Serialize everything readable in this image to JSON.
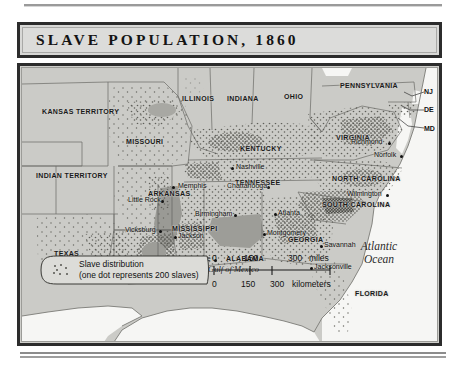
{
  "title": "SLAVE POPULATION, 1860",
  "map": {
    "states": [
      {
        "name": "KANSAS TERRITORY",
        "x": 20,
        "y": 40
      },
      {
        "name": "INDIAN TERRITORY",
        "x": 14,
        "y": 104
      },
      {
        "name": "MISSOURI",
        "x": 104,
        "y": 70
      },
      {
        "name": "ILLINOIS",
        "x": 160,
        "y": 27
      },
      {
        "name": "INDIANA",
        "x": 205,
        "y": 27
      },
      {
        "name": "OHIO",
        "x": 262,
        "y": 25
      },
      {
        "name": "PENNSYLVANIA",
        "x": 318,
        "y": 14
      },
      {
        "name": "KENTUCKY",
        "x": 218,
        "y": 77
      },
      {
        "name": "VIRGINIA",
        "x": 314,
        "y": 66
      },
      {
        "name": "TENNESSEE",
        "x": 213,
        "y": 111
      },
      {
        "name": "ARKANSAS",
        "x": 126,
        "y": 122
      },
      {
        "name": "NORTH CAROLINA",
        "x": 310,
        "y": 107
      },
      {
        "name": "SOUTH CAROLINA",
        "x": 305,
        "y": 136
      },
      {
        "name": "MISSISSIPPI",
        "x": 156,
        "y": 157
      },
      {
        "name": "ALABAMA",
        "x": 204,
        "y": 187
      },
      {
        "name": "GEORGIA",
        "x": 270,
        "y": 168
      },
      {
        "name": "LOUISIANA",
        "x": 112,
        "y": 190
      },
      {
        "name": "TEXAS",
        "x": 32,
        "y": 182
      },
      {
        "name": "FLORIDA",
        "x": 337,
        "y": 222
      }
    ],
    "state_abbreviations": [
      {
        "name": "NJ",
        "x": 402,
        "y": 20
      },
      {
        "name": "DE",
        "x": 402,
        "y": 38
      },
      {
        "name": "MD",
        "x": 402,
        "y": 57
      }
    ],
    "cities": [
      {
        "name": "Richmond",
        "x": 329,
        "y": 73,
        "dot": "right"
      },
      {
        "name": "Norfolk",
        "x": 352,
        "y": 86,
        "dot": "right"
      },
      {
        "name": "Nashville",
        "x": 214,
        "y": 98,
        "dot": "left"
      },
      {
        "name": "Memphis",
        "x": 156,
        "y": 117,
        "dot": "right"
      },
      {
        "name": "Chattanooga",
        "x": 205,
        "y": 117,
        "dot": "right"
      },
      {
        "name": "Little Rock",
        "x": 108,
        "y": 131,
        "dot": "right"
      },
      {
        "name": "Wilmington",
        "x": 327,
        "y": 125,
        "dot": "right"
      },
      {
        "name": "Birmingham",
        "x": 173,
        "y": 145,
        "dot": "right"
      },
      {
        "name": "Atlanta",
        "x": 256,
        "y": 144,
        "dot": "left"
      },
      {
        "name": "Vicksburg",
        "x": 103,
        "y": 161,
        "dot": "right"
      },
      {
        "name": "Jackson",
        "x": 156,
        "y": 167,
        "dot": "left"
      },
      {
        "name": "Montgomery",
        "x": 245,
        "y": 164,
        "dot": "left"
      },
      {
        "name": "Savannah",
        "x": 302,
        "y": 176,
        "dot": "left"
      },
      {
        "name": "Mobile",
        "x": 168,
        "y": 190,
        "dot": "right"
      },
      {
        "name": "Jacksonville",
        "x": 292,
        "y": 198,
        "dot": "left"
      },
      {
        "name": "San Antonio",
        "x": 26,
        "y": 207,
        "dot": "left"
      },
      {
        "name": "Houston",
        "x": 81,
        "y": 203,
        "dot": "left"
      },
      {
        "name": "New Orleans",
        "x": 137,
        "y": 205,
        "dot": "right"
      }
    ],
    "water_labels": [
      {
        "name": "Atlantic Ocean",
        "line1": "Atlantic",
        "line2": "Ocean",
        "x": 340,
        "y": 178
      },
      {
        "name": "Gulf of Mexico",
        "line1": "Gulf of Mexico",
        "x": 190,
        "y": 198
      }
    ]
  },
  "legend": {
    "line1": "Slave distribution",
    "line2": "(one dot represents 200 slaves)"
  },
  "scale": {
    "miles": {
      "unit_label": "miles",
      "ticks": [
        "0",
        "150",
        "300"
      ]
    },
    "kilometers": {
      "unit_label": "kilometers",
      "ticks": [
        "0",
        "150",
        "300"
      ]
    }
  },
  "colors": {
    "frame": "#2c2c2c",
    "land": "#cbcbc7",
    "water": "#f4f4f2",
    "dense_shade": "#9f9f9a",
    "dot": "#5a5a56"
  }
}
